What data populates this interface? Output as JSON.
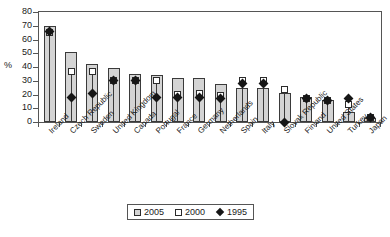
{
  "chart_data": {
    "type": "bar",
    "title": "",
    "xlabel": "",
    "ylabel": "%",
    "ylim": [
      0,
      80
    ],
    "yticks": [
      0,
      10,
      20,
      30,
      40,
      50,
      60,
      70,
      80
    ],
    "grid": false,
    "legend_position": "bottom-center",
    "categories": [
      "Ireland",
      "Czech Republic",
      "Sweden",
      "United Kingdom",
      "Canada",
      "Portugal",
      "France",
      "Germany",
      "Netherlands",
      "Spain",
      "Italy",
      "Slovak Republic",
      "Finland",
      "United States",
      "Turkey",
      "Japan"
    ],
    "series": [
      {
        "name": "2005",
        "marker": "grey-bar",
        "values": [
          70,
          51,
          42,
          39,
          35,
          34,
          32,
          32,
          28,
          25,
          25,
          21,
          18,
          16,
          7,
          3
        ]
      },
      {
        "name": "2000",
        "marker": "open-square",
        "values": [
          65,
          37,
          37,
          30,
          30,
          30,
          20,
          21,
          19,
          30,
          30,
          24,
          17,
          16,
          13,
          3
        ]
      },
      {
        "name": "1995",
        "marker": "filled-diamond",
        "values": [
          66,
          18,
          21,
          30,
          30,
          18,
          18,
          18,
          17,
          28,
          28,
          0,
          17,
          16,
          17,
          3
        ]
      }
    ]
  },
  "legend": {
    "items": [
      {
        "label": "2005",
        "swatch": "grey-square-icon"
      },
      {
        "label": "2000",
        "swatch": "white-square-icon"
      },
      {
        "label": "1995",
        "swatch": "black-diamond-icon"
      }
    ]
  },
  "colors": {
    "bar_fill": "#d4d4d4",
    "bar_stroke": "#3a3a3a",
    "marker_open": "#ffffff",
    "marker_filled": "#161616",
    "axis": "#555555",
    "text": "#1a1a1a"
  }
}
